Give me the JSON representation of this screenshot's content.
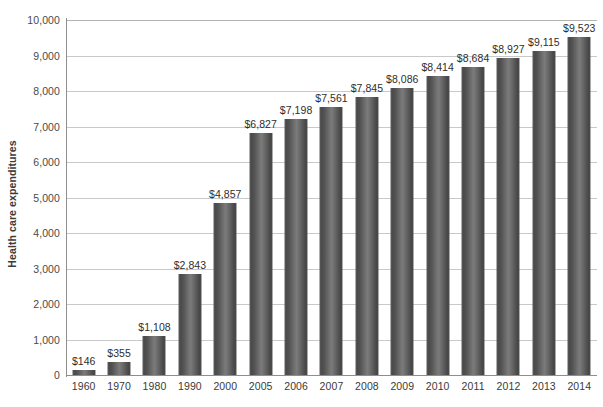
{
  "chart_data": {
    "type": "bar",
    "title": "",
    "xlabel": "",
    "ylabel": "Health care expenditures",
    "ylim": [
      0,
      10000
    ],
    "grid": true,
    "legend": "none",
    "categories": [
      "1960",
      "1970",
      "1980",
      "1990",
      "2000",
      "2005",
      "2006",
      "2007",
      "2008",
      "2009",
      "2010",
      "2011",
      "2012",
      "2013",
      "2014"
    ],
    "values": [
      146,
      355,
      1108,
      2843,
      4857,
      6827,
      7198,
      7561,
      7845,
      8086,
      8414,
      8684,
      8927,
      9115,
      9523
    ],
    "value_labels": [
      "$146",
      "$355",
      "$1,108",
      "$2,843",
      "$4,857",
      "$6,827",
      "$7,198",
      "$7,561",
      "$7,845",
      "$8,086",
      "$8,414",
      "$8,684",
      "$8,927",
      "$9,115",
      "$9,523"
    ],
    "y_ticks": [
      0,
      1000,
      2000,
      3000,
      4000,
      5000,
      6000,
      7000,
      8000,
      9000,
      10000
    ],
    "y_tick_labels": [
      "0",
      "1,000",
      "2,000",
      "3,000",
      "4,000",
      "5,000",
      "6,000",
      "7,000",
      "8,000",
      "9,000",
      "10,000"
    ],
    "colors": {
      "bar_dark": "#444444",
      "bar_light": "#7b7b7b",
      "gridline": "#c9c9c9",
      "axis": "#8e8e8e",
      "text": "#2e2e2e",
      "background": "#ffffff"
    }
  }
}
